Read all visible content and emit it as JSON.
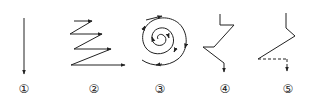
{
  "figure": {
    "panels": [
      {
        "id": 1,
        "label": "①",
        "path_type": "straight-down",
        "x_center": 24
      },
      {
        "id": 2,
        "label": "②",
        "path_type": "zigzag-right",
        "x_center": 94
      },
      {
        "id": 3,
        "label": "③",
        "path_type": "spiral",
        "x_center": 160
      },
      {
        "id": 4,
        "label": "④",
        "path_type": "angular-zigzag-down",
        "x_center": 225
      },
      {
        "id": 5,
        "label": "⑤",
        "path_type": "angular-with-dashed-segment",
        "x_center": 290
      }
    ],
    "stroke_color": "#222222",
    "background": "#ffffff"
  }
}
